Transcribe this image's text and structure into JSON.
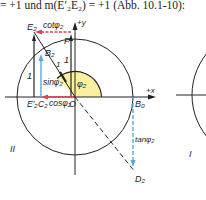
{
  "header": {
    "text": "= +1 und m(E′₂E₂) = +1 (Abb. 10.1-10):"
  },
  "diagram": {
    "labels": {
      "E2": "E₂",
      "cot": "cotφ₂",
      "y_axis": "+y",
      "F": "F",
      "one_right": "1",
      "one_left": "1",
      "B2": "B₂",
      "B2_one": "1",
      "sin": "sinφ₂",
      "phi": "φ₂",
      "E2_prime": "E′₂",
      "C2": "C₂",
      "cos": "cosφ₂",
      "O": "O",
      "x_axis": "+x",
      "B0": "B₀",
      "tan": "tanφ₂",
      "D2": "D₂",
      "quadrant_II": "II",
      "quadrant_I": "I"
    },
    "colors": {
      "red_arrow": "#e0405a",
      "blue_arrow": "#5aa8d8",
      "angle_fill": "#fbf0a0",
      "line": "#222222"
    }
  }
}
